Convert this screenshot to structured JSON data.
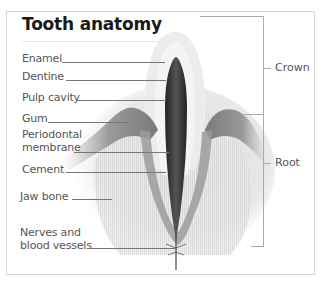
{
  "diagram": {
    "title": "Tooth anatomy",
    "left_labels": [
      {
        "id": "enamel",
        "text": "Enamel"
      },
      {
        "id": "dentine",
        "text": "Dentine"
      },
      {
        "id": "pulp-cavity",
        "text": "Pulp cavity"
      },
      {
        "id": "gum",
        "text": "Gum"
      },
      {
        "id": "periodontal-membrane",
        "text": "Periodontal membrane",
        "line1": "Periodontal",
        "line2": "membrane"
      },
      {
        "id": "cement",
        "text": "Cement"
      },
      {
        "id": "jaw-bone",
        "text": "Jaw bone"
      },
      {
        "id": "nerves-blood-vessels",
        "text": "Nerves and blood vessels",
        "line1": "Nerves and",
        "line2": "blood vessels"
      }
    ],
    "right_labels": [
      {
        "id": "crown",
        "text": "Crown"
      },
      {
        "id": "root",
        "text": "Root"
      }
    ],
    "colors": {
      "text": "#555555",
      "title": "#1a1a1a",
      "pulp": "#333333",
      "gum": "#8a8a8a",
      "bone": "#e4e4e4",
      "border": "#d8d8d8"
    }
  }
}
